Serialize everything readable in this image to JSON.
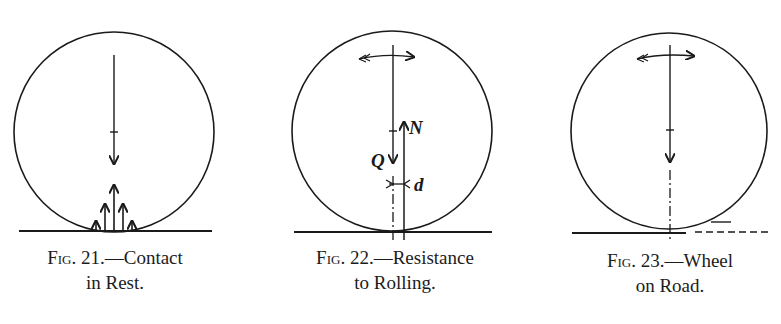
{
  "figures": [
    {
      "id": "fig21",
      "number_prefix": "Fig.",
      "number": "21.",
      "caption_line1": "—Contact",
      "caption_line2": "in Rest.",
      "description": "Wheel at rest with downward load arrow and distributed upward contact pressure arrows"
    },
    {
      "id": "fig22",
      "number_prefix": "Fig.",
      "number": "22.",
      "caption_line1": "—Resistance",
      "caption_line2": "to Rolling.",
      "labels": {
        "load": "Q",
        "normal": "N",
        "offset": "d"
      },
      "description": "Rolling wheel with rotation arrow, load Q, normal force N offset by distance d"
    },
    {
      "id": "fig23",
      "number_prefix": "Fig.",
      "number": "23.",
      "caption_line1": "—Wheel",
      "caption_line2": "on Road.",
      "description": "Wheel on road with rotation arrow, load arrow, dash-dot center line, dashed road ahead"
    }
  ],
  "colors": {
    "ink": "#1a1a1a",
    "paper": "#ffffff"
  }
}
